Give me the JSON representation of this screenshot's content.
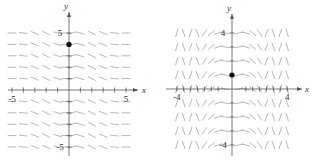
{
  "chart_data": [
    {
      "type": "slope_field",
      "title": "",
      "xlabel": "x",
      "ylabel": "y",
      "xlim": [
        -5,
        5
      ],
      "ylim": [
        -5,
        5
      ],
      "x_tick_labels": [
        "-5",
        "5"
      ],
      "y_tick_labels": [
        "5",
        "-5"
      ],
      "x_ticks": [
        -5,
        -4,
        -3,
        -2,
        -1,
        1,
        2,
        3,
        4,
        5
      ],
      "y_ticks": [
        -5,
        -4,
        -3,
        -2,
        -1,
        1,
        2,
        3,
        4,
        5
      ],
      "grid_x": [
        -5,
        -4,
        -3,
        -2,
        -1,
        0,
        1,
        2,
        3,
        4,
        5
      ],
      "grid_y": [
        -5,
        -4,
        -3,
        -2,
        -1,
        1,
        2,
        3,
        4,
        5
      ],
      "slopes_by_x": [
        0,
        -0.1,
        -0.4,
        -0.5,
        -0.3,
        0,
        0.3,
        -0.3,
        -0.5,
        -0.4,
        -0.1,
        0
      ],
      "slope_columns": [
        -5,
        -4,
        -3,
        -2,
        -1,
        -0.3,
        0.3,
        1,
        2,
        3,
        4,
        5
      ],
      "point": {
        "x": 0,
        "y": 4
      },
      "grid": false
    },
    {
      "type": "slope_field",
      "title": "",
      "xlabel": "x",
      "ylabel": "y",
      "xlim": [
        -4,
        4
      ],
      "ylim": [
        -4,
        4
      ],
      "x_tick_labels": [
        "-4",
        "4"
      ],
      "y_tick_labels": [
        "4",
        "-4"
      ],
      "x_ticks": [
        -4,
        -3.5,
        -3,
        -2.5,
        -2,
        -1.5,
        -1,
        1,
        1.5,
        2,
        2.5,
        3,
        3.5,
        4
      ],
      "y_ticks": [
        -4,
        -3,
        -2,
        -1,
        1,
        2,
        3,
        4
      ],
      "slope_columns": [
        -4,
        -3.5,
        -3,
        -2.5,
        -2,
        -1.5,
        -1,
        -0.5,
        0.5,
        1,
        1.5,
        2,
        2.5,
        3,
        3.5,
        4
      ],
      "slopes_by_x": [
        3,
        -3,
        3,
        -2.5,
        1.5,
        0.8,
        0.3,
        -0.2,
        0.2,
        -0.3,
        -0.8,
        -1.5,
        2.5,
        -3,
        3,
        -3
      ],
      "grid_y": [
        -4,
        -3,
        -2,
        -1,
        0,
        1,
        2,
        3,
        4
      ],
      "point": {
        "x": 0,
        "y": 1
      },
      "grid": false
    }
  ]
}
